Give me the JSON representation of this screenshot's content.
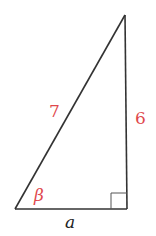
{
  "diagram": {
    "type": "right-triangle",
    "labels": {
      "hypotenuse": "7",
      "vertical_leg": "6",
      "horizontal_leg": "a",
      "angle": "β"
    },
    "vertices": {
      "top": [
        125,
        15
      ],
      "bottom_left": [
        15,
        209
      ],
      "bottom_right": [
        127,
        209
      ]
    },
    "right_angle_at": "bottom_right",
    "colors": {
      "lines": "#333333",
      "highlight_labels": "#e0484d",
      "variable_label": "#222222"
    }
  }
}
